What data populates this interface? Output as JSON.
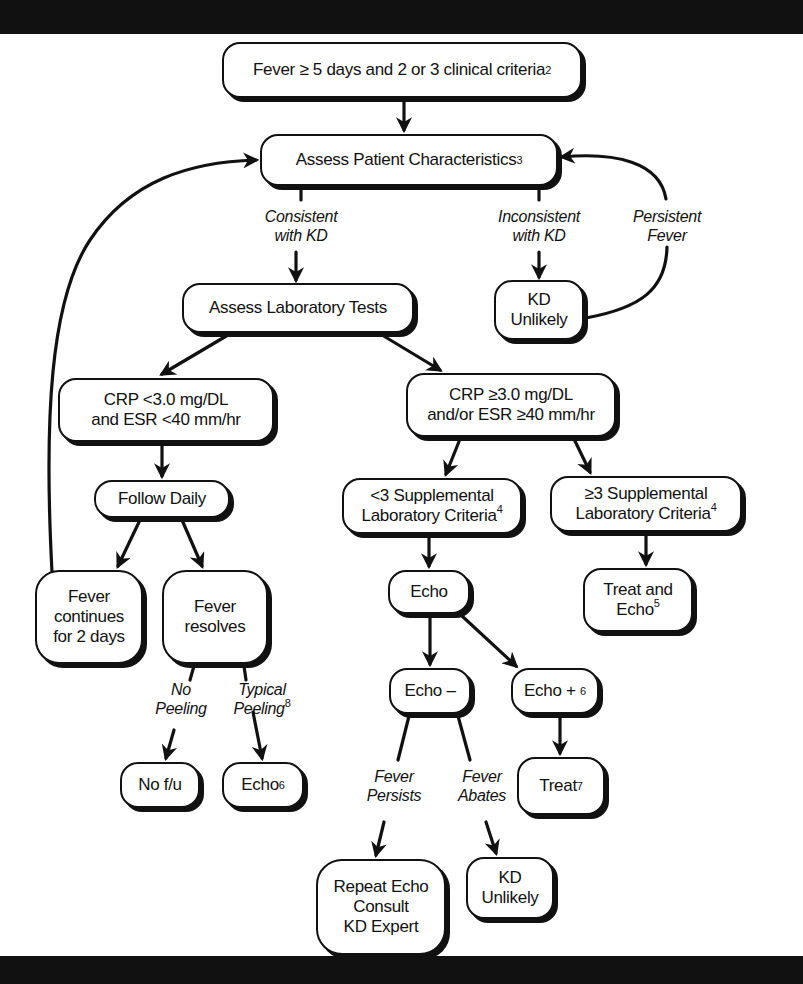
{
  "diagram": {
    "type": "flowchart",
    "nodes": {
      "start": {
        "text": "Fever ≥ 5 days and 2 or 3 clinical criteria",
        "sup": "2"
      },
      "assess_patient": {
        "text": "Assess Patient Characteristics",
        "sup": "3"
      },
      "assess_lab": {
        "text": "Assess Laboratory Tests"
      },
      "kd_unlikely_top": {
        "line1": "KD",
        "line2": "Unlikely"
      },
      "crp_low": {
        "line1": "CRP <3.0 mg/DL",
        "line2": "and ESR <40 mm/hr"
      },
      "crp_high": {
        "line1": "CRP ≥3.0 mg/DL",
        "line2": "and/or ESR ≥40 mm/hr"
      },
      "follow_daily": {
        "text": "Follow Daily"
      },
      "supp_lt3": {
        "line1": "<3 Supplemental",
        "line2": "Laboratory Criteria",
        "sup": "4"
      },
      "supp_ge3": {
        "line1": "≥3 Supplemental",
        "line2": "Laboratory Criteria",
        "sup": "4"
      },
      "fever_continues": {
        "line1": "Fever",
        "line2": "continues",
        "line3": "for 2 days"
      },
      "fever_resolves": {
        "line1": "Fever",
        "line2": "resolves"
      },
      "echo": {
        "text": "Echo"
      },
      "treat_and_echo": {
        "line1": "Treat and",
        "line2": "Echo",
        "sup": "5"
      },
      "echo_neg": {
        "text": "Echo –"
      },
      "echo_pos": {
        "text": "Echo + ",
        "sup": "6"
      },
      "no_fu": {
        "text": "No f/u"
      },
      "echo_after_peeling": {
        "text": "Echo",
        "sup": "6"
      },
      "treat": {
        "text": "Treat",
        "sup": "7"
      },
      "repeat_echo": {
        "line1": "Repeat Echo",
        "line2": "Consult",
        "line3": "KD Expert"
      },
      "kd_unlikely_bottom": {
        "line1": "KD",
        "line2": "Unlikely"
      }
    },
    "edge_labels": {
      "consistent": {
        "line1": "Consistent",
        "line2": "with KD"
      },
      "inconsistent": {
        "line1": "Inconsistent",
        "line2": "with KD"
      },
      "persistent_fever": {
        "line1": "Persistent",
        "line2": "Fever"
      },
      "no_peeling": {
        "line1": "No",
        "line2": "Peeling"
      },
      "typical_peeling": {
        "line1": "Typical",
        "line2": "Peeling",
        "sup": "8"
      },
      "fever_persists": {
        "line1": "Fever",
        "line2": "Persists"
      },
      "fever_abates": {
        "line1": "Fever",
        "line2": "Abates"
      }
    },
    "colors": {
      "ink": "#111111",
      "background": "#ffffff",
      "band": "#111111"
    }
  }
}
